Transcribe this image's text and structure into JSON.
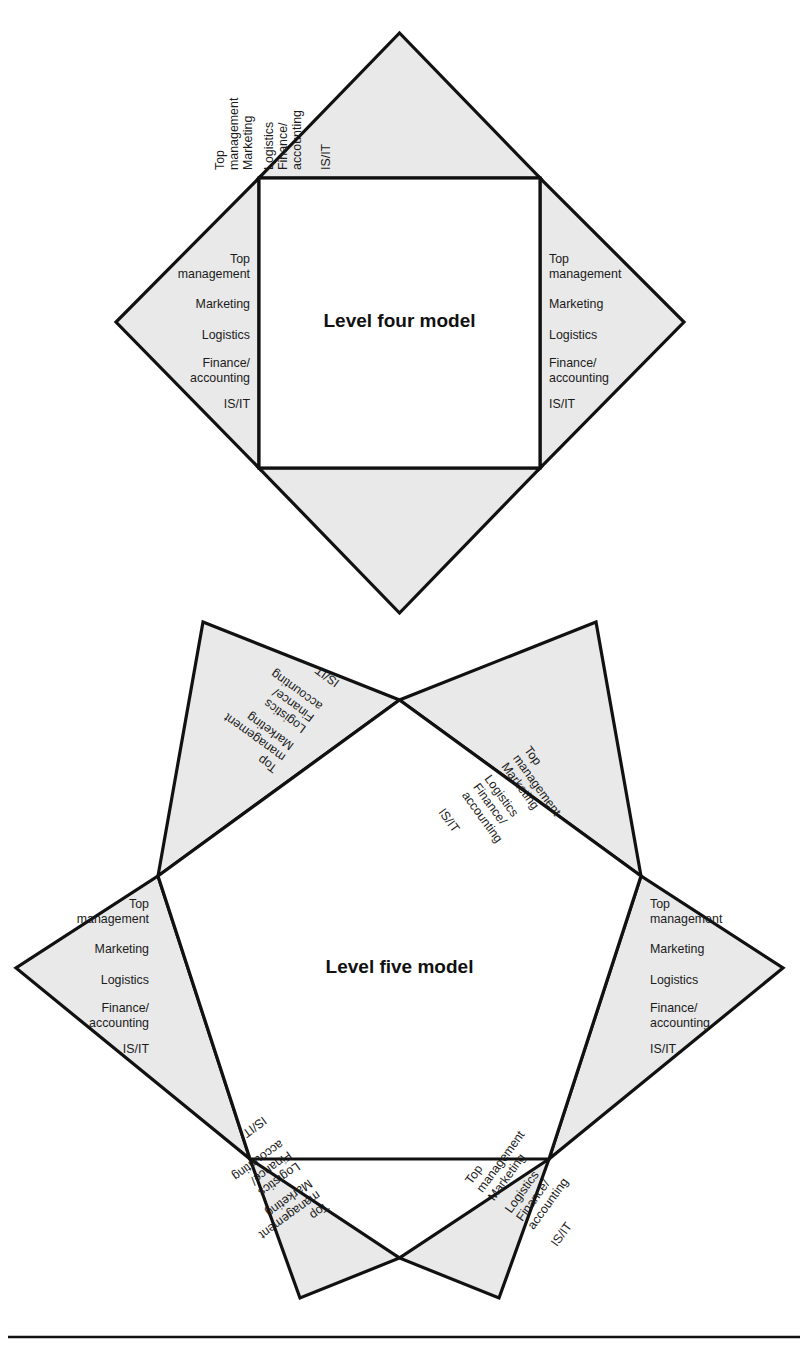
{
  "figure": {
    "departments": [
      "Top\nmanagement",
      "Marketing",
      "Logistics",
      "Finance/\naccounting",
      "IS/IT"
    ],
    "dept_flat": [
      "Top management",
      "Marketing",
      "Logistics",
      "Finance/ accounting",
      "IS/IT"
    ]
  },
  "level_four": {
    "title": "Level four model",
    "shape": "square with four outward triangles (four-pointed star)",
    "facets": [
      {
        "id": "top",
        "label": "top-facet",
        "text_rotation_deg": -90
      },
      {
        "id": "right",
        "label": "right-facet",
        "text_rotation_deg": 0
      },
      {
        "id": "bottom",
        "label": "bottom-facet",
        "text_rotation_deg": -90
      },
      {
        "id": "left",
        "label": "left-facet",
        "text_rotation_deg": 0
      }
    ]
  },
  "level_five": {
    "title": "Level five model",
    "shape": "pentagon with five outward triangles (five-pointed star)",
    "facets": [
      {
        "id": "upper-left",
        "label": "upper-left-facet",
        "text_rotation_deg": 216
      },
      {
        "id": "upper-right",
        "label": "upper-right-facet",
        "text_rotation_deg": 54
      },
      {
        "id": "right",
        "label": "right-facet",
        "text_rotation_deg": 0
      },
      {
        "id": "lower-left",
        "label": "lower-left-facet",
        "text_rotation_deg": 144
      },
      {
        "id": "lower-right",
        "label": "lower-right-facet",
        "text_rotation_deg": -54
      },
      {
        "id": "left",
        "label": "left-facet",
        "text_rotation_deg": 0
      }
    ]
  },
  "colors": {
    "facet_fill": "#e9e9e9",
    "core_fill": "#ffffff",
    "stroke": "#111111",
    "text": "#1b1b1b"
  }
}
